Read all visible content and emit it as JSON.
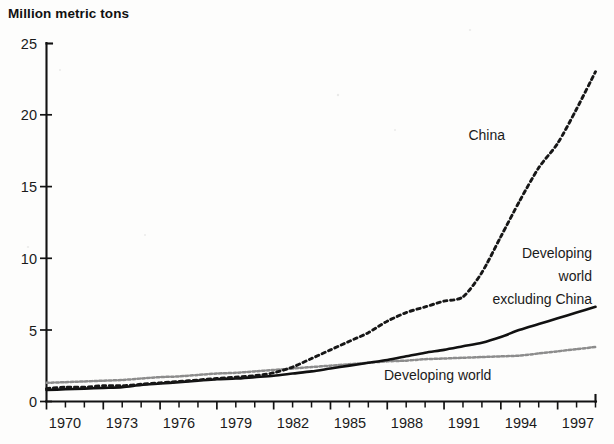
{
  "chart_data": {
    "type": "line",
    "title": "Million metric tons",
    "xlabel": "",
    "ylabel": "Million metric tons",
    "ylim": [
      0,
      25
    ],
    "xlim": [
      1970,
      1999
    ],
    "yticks": [
      0,
      5,
      10,
      15,
      20,
      25
    ],
    "xticks": [
      1970,
      1973,
      1976,
      1979,
      1982,
      1985,
      1988,
      1991,
      1994,
      1997
    ],
    "xticks_all": [
      1970,
      1971,
      1972,
      1973,
      1974,
      1975,
      1976,
      1977,
      1978,
      1979,
      1980,
      1981,
      1982,
      1983,
      1984,
      1985,
      1986,
      1987,
      1988,
      1989,
      1990,
      1991,
      1992,
      1993,
      1994,
      1995,
      1996,
      1997,
      1998,
      1999
    ],
    "grid": false,
    "legend_position": "inline-annotations",
    "x": [
      1970,
      1971,
      1972,
      1973,
      1974,
      1975,
      1976,
      1977,
      1978,
      1979,
      1980,
      1981,
      1982,
      1983,
      1984,
      1985,
      1986,
      1987,
      1988,
      1989,
      1990,
      1991,
      1992,
      1993,
      1994,
      1995,
      1996,
      1997,
      1998,
      1999
    ],
    "series": [
      {
        "name": "China",
        "style": "dashed-dark",
        "label": "China",
        "values": [
          0.9,
          1.0,
          1.0,
          1.1,
          1.1,
          1.2,
          1.3,
          1.4,
          1.5,
          1.6,
          1.7,
          1.8,
          2.0,
          2.4,
          3.0,
          3.6,
          4.2,
          4.8,
          5.6,
          6.2,
          6.6,
          7.0,
          7.3,
          9.0,
          11.5,
          14.0,
          16.3,
          18.0,
          20.4,
          23.0
        ]
      },
      {
        "name": "Developing world excluding China",
        "style": "solid-dark",
        "label": "Developing world excluding China",
        "values": [
          0.8,
          0.85,
          0.9,
          0.95,
          1.0,
          1.15,
          1.25,
          1.35,
          1.45,
          1.55,
          1.6,
          1.7,
          1.8,
          1.95,
          2.1,
          2.3,
          2.5,
          2.7,
          2.9,
          3.15,
          3.4,
          3.6,
          3.85,
          4.1,
          4.5,
          5.0,
          5.4,
          5.8,
          6.2,
          6.6
        ]
      },
      {
        "name": "Developing world",
        "style": "dashed-gray",
        "label": "Developing world",
        "values": [
          1.3,
          1.35,
          1.4,
          1.45,
          1.5,
          1.6,
          1.7,
          1.75,
          1.85,
          1.95,
          2.0,
          2.1,
          2.2,
          2.3,
          2.4,
          2.5,
          2.6,
          2.7,
          2.8,
          2.85,
          2.95,
          3.0,
          3.05,
          3.1,
          3.15,
          3.2,
          3.35,
          3.5,
          3.65,
          3.8
        ]
      }
    ],
    "annotations": [
      {
        "text": "China",
        "series": "China"
      },
      {
        "text": "Developing",
        "series": "Developing world excluding China"
      },
      {
        "text": "world",
        "series": "Developing world excluding China"
      },
      {
        "text": "excluding China",
        "series": "Developing world excluding China"
      },
      {
        "text": "Developing world",
        "series": "Developing world"
      }
    ]
  },
  "axis": {
    "y_tick_labels": [
      "25",
      "20",
      "15",
      "10",
      "5",
      "0"
    ],
    "x_tick_labels": [
      "1970",
      "1973",
      "1976",
      "1979",
      "1982",
      "1985",
      "1988",
      "1991",
      "1994",
      "1997"
    ]
  },
  "labels": {
    "china": "China",
    "dev_excl_line1": "Developing",
    "dev_excl_line2": "world",
    "dev_excl_line3": "excluding China",
    "developing_world": "Developing world"
  }
}
